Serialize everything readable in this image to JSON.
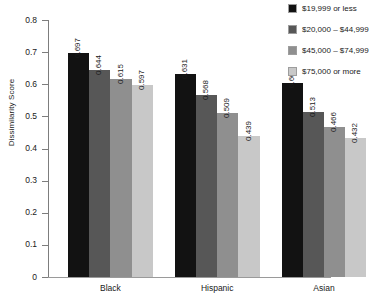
{
  "chart_data": {
    "type": "bar",
    "title": "",
    "xlabel": "",
    "ylabel": "Dissimilarity Score",
    "ylim": [
      0,
      0.8
    ],
    "ytick_step": 0.1,
    "grid": false,
    "legend_position": "top-right",
    "orientation": "grouped-vertical",
    "categories": [
      "Black",
      "Hispanic",
      "Asian"
    ],
    "ytick_labels": [
      "0.8",
      "0.7",
      "0.6",
      "0.5",
      "0.4",
      "0.3",
      "0.2",
      "0.1",
      "0"
    ],
    "ytick_values": [
      0.8,
      0.7,
      0.6,
      0.5,
      0.4,
      0.3,
      0.2,
      0.1,
      0
    ],
    "series": [
      {
        "name": "$19,999 or less",
        "color": "#121212",
        "values": [
          0.697,
          0.631,
          0.603
        ],
        "labels": [
          "0.697",
          "0.631",
          "0.603"
        ]
      },
      {
        "name": "$20,000 – $44,999",
        "color": "#575757",
        "values": [
          0.644,
          0.568,
          0.513
        ],
        "labels": [
          "0.644",
          "0.568",
          "0.513"
        ]
      },
      {
        "name": "$45,000 – $74,999",
        "color": "#8f8f8f",
        "values": [
          0.615,
          0.509,
          0.466
        ],
        "labels": [
          "0.615",
          "0.509",
          "0.466"
        ]
      },
      {
        "name": "$75,000 or more",
        "color": "#c8c8c8",
        "values": [
          0.597,
          0.439,
          0.432
        ],
        "labels": [
          "0.597",
          "0.439",
          "0.432"
        ]
      }
    ]
  }
}
